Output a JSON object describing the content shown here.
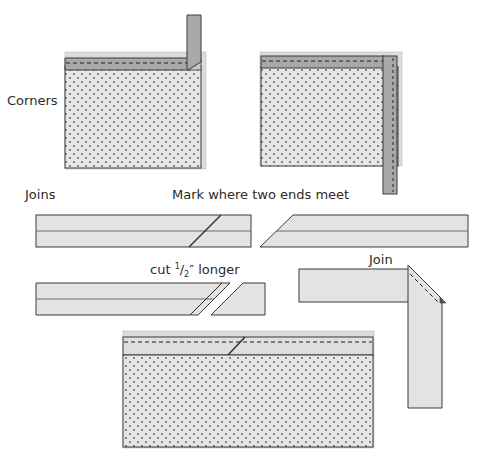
{
  "labels": {
    "corners": "Corners",
    "joins": "Joins",
    "mark": "Mark where two ends meet",
    "cut_prefix": "cut ",
    "cut_num": "1",
    "cut_slash": "/",
    "cut_den": "2",
    "cut_suffix": "″ longer",
    "join": "Join"
  },
  "colors": {
    "background": "#ffffff",
    "quilt_fill": "#e6e6e6",
    "quilt_dots": "#555555",
    "binding_dark": "#a9a9a9",
    "binding_light": "#d9d9d9",
    "outline": "#3a3a3a",
    "backing": "#dcdcdc"
  },
  "figures": [
    {
      "id": "corner-step-1",
      "description": "Binding strip folded up at corner at 45 degrees"
    },
    {
      "id": "corner-step-2",
      "description": "Binding strip folded back down along next side"
    },
    {
      "id": "join-mark",
      "description": "Two strip ends overlapped; mark where ends meet"
    },
    {
      "id": "join-cut",
      "description": "Cut one end 1/2 inch longer"
    },
    {
      "id": "join-sew",
      "description": "Join strip ends at right angle and sew diagonal"
    },
    {
      "id": "join-finished",
      "description": "Joined binding sewn to quilt edge"
    }
  ]
}
